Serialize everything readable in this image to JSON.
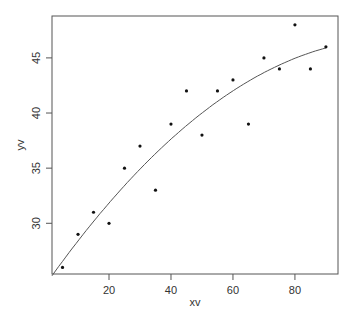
{
  "chart_data": {
    "type": "scatter",
    "title": "",
    "xlabel": "xv",
    "ylabel": "yv",
    "xlim": [
      1.6,
      93.9
    ],
    "ylim": [
      25.4,
      48.8
    ],
    "grid": false,
    "legend": null,
    "x_ticks": [
      20,
      40,
      60,
      80
    ],
    "y_ticks": [
      30,
      35,
      40,
      45
    ],
    "series": [
      {
        "name": "points",
        "kind": "scatter",
        "x": [
          5,
          10,
          15,
          20,
          25,
          30,
          35,
          40,
          45,
          50,
          55,
          60,
          65,
          70,
          75,
          80,
          85,
          90
        ],
        "y": [
          26,
          29,
          31,
          30,
          35,
          37,
          33,
          39,
          42,
          38,
          42,
          43,
          39,
          45,
          44,
          48,
          44,
          46
        ]
      },
      {
        "name": "fitted curve",
        "kind": "line",
        "model": "quadratic",
        "coefficients": {
          "a": 24.61,
          "b": 0.3968,
          "c": -0.00178
        },
        "x_range": [
          1.6,
          90
        ]
      }
    ]
  },
  "colors": {
    "points": "#111111",
    "curve": "#555555",
    "axes": "#555555",
    "text": "#333333"
  }
}
